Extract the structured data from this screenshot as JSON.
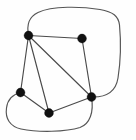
{
  "figure": {
    "width": 136,
    "height": 140,
    "background_color": "#fefefe",
    "vertex_color": "#111111",
    "edge_color": "#4a4a4a",
    "boundary_color": "#555555",
    "vertex_radius": 4.4,
    "stroke_width": 1.15
  },
  "graph_data": {
    "type": "node-link-diagram",
    "directed": false,
    "vertex_count": 5,
    "edge_count": 6,
    "nodes": [
      {
        "id": "v1",
        "label": "",
        "x": 28.5,
        "y": 35.5,
        "name": "top-left-vertex"
      },
      {
        "id": "v2",
        "label": "",
        "x": 82.0,
        "y": 38.5,
        "name": "top-right-vertex"
      },
      {
        "id": "v3",
        "label": "",
        "x": 20.5,
        "y": 92.5,
        "name": "left-vertex"
      },
      {
        "id": "v4",
        "label": "",
        "x": 49.0,
        "y": 113.0,
        "name": "bottom-vertex"
      },
      {
        "id": "v5",
        "label": "",
        "x": 91.5,
        "y": 97.0,
        "name": "bottom-right-vertex"
      }
    ],
    "edges": [
      {
        "source": "v1",
        "target": "v2",
        "name": "edge-top-left-top-right"
      },
      {
        "source": "v1",
        "target": "v3",
        "name": "edge-top-left-left"
      },
      {
        "source": "v1",
        "target": "v4",
        "name": "edge-top-left-bottom"
      },
      {
        "source": "v1",
        "target": "v5",
        "name": "edge-top-left-bottom-right"
      },
      {
        "source": "v2",
        "target": "v5",
        "name": "edge-top-right-bottom-right"
      },
      {
        "source": "v3",
        "target": "v4",
        "name": "edge-left-bottom"
      },
      {
        "source": "v4",
        "target": "v5",
        "name": "edge-bottom-bottom-right"
      }
    ],
    "boundary_curves": [
      {
        "id": "c1",
        "name": "outer-boundary-top",
        "from": "v1",
        "to": "v5",
        "path": "M 28.5 35.5 C 26.5 24.0 29.0 17.0 38.0 12.5 C 52.0 5.5 82.0 6.5 100.0 9.5 C 113.0 11.8 118.5 16.0 119.5 25.0 C 121.0 41.0 120.5 62.0 118.0 78.0 C 116.0 90.5 107.0 97.5 91.5 97.0"
      },
      {
        "id": "c2",
        "name": "outer-boundary-bottom",
        "from": "v3",
        "to": "v5",
        "path": "M 20.5 92.5 C 12.5 94.5 7.5 100.0 6.5 108.0 C 5.0 118.5 10.0 126.5 21.0 129.0 C 38.0 132.5 66.0 132.0 80.0 127.5 C 90.0 124.0 94.0 112.0 91.5 97.0"
      }
    ]
  }
}
